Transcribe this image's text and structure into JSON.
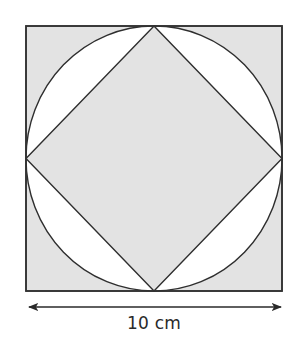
{
  "diagram": {
    "colors": {
      "fill": "#e3e3e3",
      "background": "#ffffff",
      "stroke": "#333333"
    },
    "outer_square": {
      "x": 26,
      "y": 26,
      "width": 256,
      "height": 265
    },
    "circle": {
      "cx": 154,
      "cy": 158.5,
      "rx": 128,
      "ry": 132.5
    },
    "diamond": {
      "points": [
        [
          154,
          26
        ],
        [
          282,
          158.5
        ],
        [
          154,
          291
        ],
        [
          26,
          158.5
        ]
      ]
    },
    "dimension": {
      "label": "10 cm",
      "arrow": {
        "x1": 27,
        "x2": 283,
        "y": 307
      }
    }
  }
}
